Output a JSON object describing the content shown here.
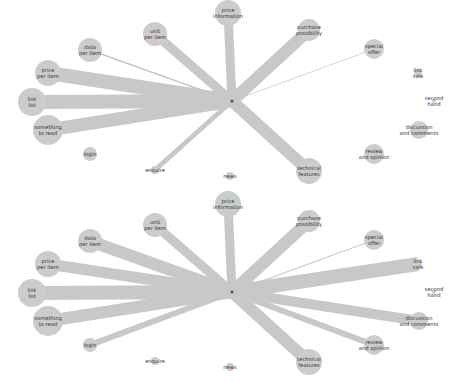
{
  "diagram": {
    "type": "radial-network",
    "colors": {
      "node": "#cccccc",
      "edge": "#c8c8c8",
      "center": "#555555",
      "label": "#333333",
      "background": "#ffffff"
    },
    "nodes": [
      {
        "id": "price-information",
        "lines": [
          "price",
          "information"
        ],
        "x": 228,
        "y": 13,
        "r": 13
      },
      {
        "id": "unit-per-item",
        "lines": [
          "unit",
          "per item"
        ],
        "x": 155,
        "y": 34,
        "r": 12
      },
      {
        "id": "purchase-possibility",
        "lines": [
          "purchase",
          "possibility"
        ],
        "x": 309,
        "y": 30,
        "r": 11
      },
      {
        "id": "data-per-item",
        "lines": [
          "data",
          "per item"
        ],
        "x": 90,
        "y": 50,
        "r": 12
      },
      {
        "id": "special-offer",
        "lines": [
          "special",
          "offer"
        ],
        "x": 374,
        "y": 49,
        "r": 10
      },
      {
        "id": "price-per-item",
        "lines": [
          "price",
          "per item"
        ],
        "x": 48,
        "y": 73,
        "r": 13
      },
      {
        "id": "link-list",
        "lines": [
          "link",
          "list"
        ],
        "x": 32,
        "y": 102,
        "r": 14
      },
      {
        "id": "link-sale",
        "lines": [
          "link",
          "sale"
        ],
        "x": 418,
        "y": 73,
        "r": 4
      },
      {
        "id": "second-hand",
        "lines": [
          "second",
          "hand"
        ],
        "x": 434,
        "y": 101,
        "r": 2
      },
      {
        "id": "something-to-read",
        "lines": [
          "something",
          "to read"
        ],
        "x": 48,
        "y": 130,
        "r": 15
      },
      {
        "id": "discussion-and-comments",
        "lines": [
          "discussion",
          "and comments"
        ],
        "x": 419,
        "y": 130,
        "r": 9
      },
      {
        "id": "review-and-opinion",
        "lines": [
          "review",
          "and opinion"
        ],
        "x": 374,
        "y": 154,
        "r": 10
      },
      {
        "id": "login",
        "lines": [
          "login"
        ],
        "x": 90,
        "y": 154,
        "r": 7
      },
      {
        "id": "enquire",
        "lines": [
          "enquire"
        ],
        "x": 155,
        "y": 170,
        "r": 4
      },
      {
        "id": "news",
        "lines": [
          "news"
        ],
        "x": 230,
        "y": 176,
        "r": 4
      },
      {
        "id": "technical-features",
        "lines": [
          "technical",
          "features"
        ],
        "x": 309,
        "y": 171,
        "r": 13
      }
    ],
    "center": {
      "x": 232,
      "y": 101
    },
    "panels": [
      {
        "name": "top",
        "offset_y": 0,
        "edges": [
          {
            "to": "price-information",
            "w": 9
          },
          {
            "to": "unit-per-item",
            "w": 9
          },
          {
            "to": "purchase-possibility",
            "w": 12
          },
          {
            "to": "data-per-item",
            "w": 1.5
          },
          {
            "to": "special-offer",
            "w": 0.8
          },
          {
            "to": "price-per-item",
            "w": 14
          },
          {
            "to": "link-list",
            "w": 14
          },
          {
            "to": "something-to-read",
            "w": 13
          },
          {
            "to": "enquire",
            "w": 5
          },
          {
            "to": "technical-features",
            "w": 12
          }
        ]
      },
      {
        "name": "bottom",
        "offset_y": 191,
        "edges": [
          {
            "to": "price-information",
            "w": 9
          },
          {
            "to": "unit-per-item",
            "w": 9
          },
          {
            "to": "purchase-possibility",
            "w": 12
          },
          {
            "to": "data-per-item",
            "w": 12
          },
          {
            "to": "special-offer",
            "w": 1.2
          },
          {
            "to": "price-per-item",
            "w": 11
          },
          {
            "to": "link-list",
            "w": 14
          },
          {
            "to": "something-to-read",
            "w": 12
          },
          {
            "to": "login",
            "w": 6
          },
          {
            "to": "link-sale",
            "w": 14
          },
          {
            "to": "discussion-and-comments",
            "w": 10
          },
          {
            "to": "review-and-opinion",
            "w": 6
          },
          {
            "to": "technical-features",
            "w": 12
          }
        ]
      }
    ]
  }
}
